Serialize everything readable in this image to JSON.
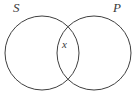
{
  "figure": {
    "type": "venn-diagram-two-sets",
    "background_color": "#ffffff",
    "stroke_color": "#3f3f3f",
    "text_color": "#3a3a3a",
    "width": 137,
    "height": 97
  },
  "labels": {
    "left_set": "S",
    "right_set": "P",
    "intersection": "x"
  },
  "geometry": {
    "left_circle": {
      "cx": 42,
      "cy": 53,
      "r": 37
    },
    "right_circle": {
      "cx": 94,
      "cy": 53,
      "r": 37
    }
  }
}
